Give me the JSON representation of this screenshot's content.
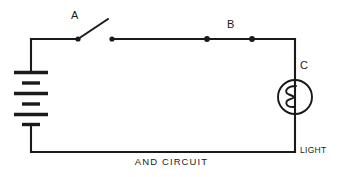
{
  "diagram": {
    "caption": "AND CIRCUIT",
    "background_color": "#ffffff",
    "line_color": "#1a1a1a",
    "components": {
      "battery": {
        "name": "battery",
        "plates": 6,
        "orientation": "vertical",
        "position": {
          "x": 31,
          "y_top": 72,
          "y_bottom": 125
        }
      },
      "switch_a": {
        "label": "A",
        "state": "open",
        "position": {
          "pivot_x": 78,
          "contact_x": 112,
          "y": 39
        }
      },
      "switch_b": {
        "label": "B",
        "state": "closed",
        "position": {
          "left_x": 207,
          "right_x": 252,
          "y": 39
        }
      },
      "lamp_c": {
        "label": "C",
        "state_line_1": "LIGHT",
        "state_line_2": "OFF",
        "position": {
          "cx": 295,
          "cy": 97,
          "r": 17
        }
      }
    },
    "loop": {
      "left_x": 31,
      "right_x": 295,
      "top_y": 39,
      "bottom_y": 152
    }
  }
}
